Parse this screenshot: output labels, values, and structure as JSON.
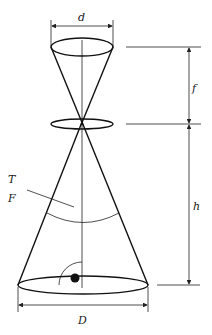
{
  "diagram": {
    "labels": {
      "top_diameter": "d",
      "focal_length": "f",
      "height": "h",
      "bottom_diameter": "D",
      "label_t": "T",
      "label_f": "F"
    },
    "colors": {
      "line": "#111111",
      "background": "#ffffff"
    }
  }
}
